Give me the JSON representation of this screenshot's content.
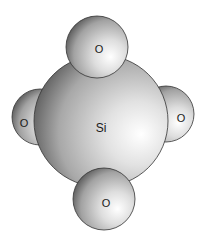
{
  "diagram": {
    "type": "space-filling molecular model",
    "central_atom": {
      "label": "Si",
      "cx": 101,
      "cy": 121,
      "rx": 67,
      "ry": 66
    },
    "atoms": [
      {
        "id": "o-left",
        "label": "O",
        "cx": 40,
        "cy": 117,
        "r": 28,
        "lx": 24,
        "ly": 127
      },
      {
        "id": "o-right",
        "label": "O",
        "cx": 166,
        "cy": 114,
        "r": 28,
        "lx": 181,
        "ly": 122
      },
      {
        "id": "o-top",
        "label": "O",
        "cx": 97,
        "cy": 47,
        "r": 31,
        "lx": 99,
        "ly": 53
      },
      {
        "id": "o-bottom",
        "label": "O",
        "cx": 104,
        "cy": 199,
        "r": 31,
        "lx": 106,
        "ly": 207
      }
    ],
    "colors": {
      "highlight": "#ffffff",
      "mid": "#c8c8c8",
      "shadow": "#555555",
      "outline": "#333333"
    }
  }
}
